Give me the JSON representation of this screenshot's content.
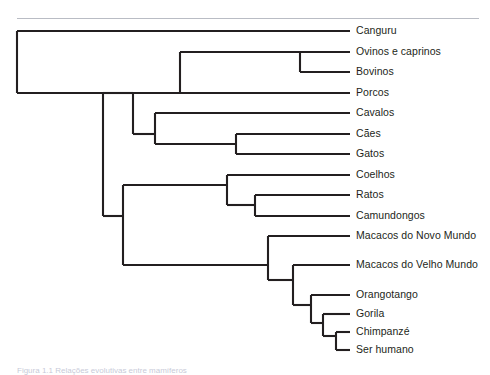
{
  "figure": {
    "type": "cladogram",
    "language": "pt-BR",
    "line_color": "#231f20",
    "rule_color": "#b9bcc4",
    "background": "#ffffff",
    "caption_partial": "Figura 1.1 Relações evolutivas entre mamíferos",
    "tip_x": 350,
    "label_x": 356,
    "root_x": 17
  },
  "taxa": [
    {
      "id": "canguru",
      "label": "Canguru",
      "y": 31
    },
    {
      "id": "ovinos",
      "label": "Ovinos e caprinos",
      "y": 52
    },
    {
      "id": "bovinos",
      "label": "Bovinos",
      "y": 72
    },
    {
      "id": "porcos",
      "label": "Porcos",
      "y": 93
    },
    {
      "id": "cavalos",
      "label": "Cavalos",
      "y": 113
    },
    {
      "id": "caes",
      "label": "Cães",
      "y": 134
    },
    {
      "id": "gatos",
      "label": "Gatos",
      "y": 154
    },
    {
      "id": "coelhos",
      "label": "Coelhos",
      "y": 175
    },
    {
      "id": "ratos",
      "label": "Ratos",
      "y": 195
    },
    {
      "id": "camundongos",
      "label": "Camundongos",
      "y": 216
    },
    {
      "id": "novo-mundo",
      "label": "Macacos do Novo Mundo",
      "y": 236
    },
    {
      "id": "velho-mundo",
      "label": "Macacos do Velho Mundo",
      "y": 265
    },
    {
      "id": "orangotango",
      "label": "Orangotango",
      "y": 295
    },
    {
      "id": "gorila",
      "label": "Gorila",
      "y": 314
    },
    {
      "id": "chimpanze",
      "label": "Chimpanzé",
      "y": 332
    },
    {
      "id": "humano",
      "label": "Ser humano",
      "y": 350
    }
  ],
  "nodes": [
    {
      "id": "root",
      "x": 17,
      "y_top": 31,
      "y_bottom": 93,
      "child_x": 103
    },
    {
      "id": "placental",
      "x": 103,
      "y_top": 93,
      "y_bottom": 216,
      "child_x": 133
    },
    {
      "id": "laurasiatheria",
      "x": 133,
      "y_top": 93,
      "y_bottom": 134,
      "child_x": 155
    },
    {
      "id": "ungulates",
      "x": 180,
      "y_top": 52,
      "y_bottom": 93,
      "child_x": 300
    },
    {
      "id": "ruminants",
      "x": 300,
      "y_top": 52,
      "y_bottom": 72,
      "child_x": 350
    },
    {
      "id": "carnivora-grp",
      "x": 155,
      "y_top": 113,
      "y_bottom": 144,
      "child_x": 236
    },
    {
      "id": "carnivora",
      "x": 236,
      "y_top": 134,
      "y_bottom": 154,
      "child_x": 350
    },
    {
      "id": "glires-prim",
      "x": 123,
      "y_top": 185,
      "y_bottom": 265,
      "child_x": 227
    },
    {
      "id": "glires",
      "x": 227,
      "y_top": 175,
      "y_bottom": 205,
      "child_x": 255
    },
    {
      "id": "rodents",
      "x": 255,
      "y_top": 195,
      "y_bottom": 216,
      "child_x": 350
    },
    {
      "id": "primates",
      "x": 268,
      "y_top": 236,
      "y_bottom": 280,
      "child_x": 293
    },
    {
      "id": "catarrhini",
      "x": 293,
      "y_top": 265,
      "y_bottom": 305,
      "child_x": 311
    },
    {
      "id": "hominidae",
      "x": 311,
      "y_top": 295,
      "y_bottom": 323,
      "child_x": 323
    },
    {
      "id": "homininae",
      "x": 323,
      "y_top": 314,
      "y_bottom": 336,
      "child_x": 336
    },
    {
      "id": "hominini",
      "x": 336,
      "y_top": 332,
      "y_bottom": 350,
      "child_x": 350
    }
  ]
}
